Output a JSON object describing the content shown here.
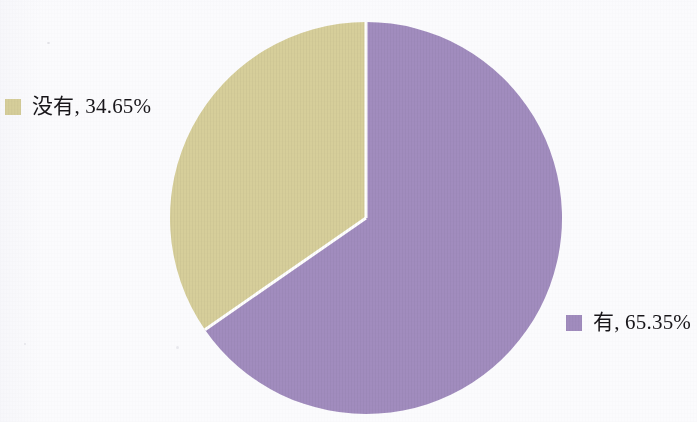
{
  "chart_data": {
    "type": "pie",
    "title": "",
    "subtitle": "",
    "xlabel": "",
    "ylabel": "",
    "legend_position": "callout-sides",
    "grid": false,
    "start_angle_deg": 0,
    "direction": "clockwise",
    "categories": [
      "有",
      "没有"
    ],
    "values": [
      65.35,
      34.65
    ],
    "value_unit": "%",
    "slices": [
      {
        "name": "有",
        "label": "有, 65.35%",
        "value": 65.35,
        "percent_text": "65.35%",
        "color": "#a18cbe",
        "start_angle_deg": 0,
        "end_angle_deg": 235.26
      },
      {
        "name": "没有",
        "label": "没有, 34.65%",
        "value": 34.65,
        "percent_text": "34.65%",
        "color": "#d6ce9a",
        "start_angle_deg": 235.26,
        "end_angle_deg": 360
      }
    ],
    "legend_entries": [
      {
        "label": "没有, 34.65%",
        "color": "#d6ce9a"
      },
      {
        "label": "有, 65.35%",
        "color": "#a18cbe"
      }
    ]
  },
  "geometry": {
    "center_x": 366,
    "center_y": 218,
    "radius": 196,
    "separator_color": "#ffffff",
    "separator_width": 3
  },
  "colors": {
    "background": "#fafafc",
    "slice_yes": "#a18cbe",
    "slice_no": "#d6ce9a",
    "text": "#18161a"
  }
}
